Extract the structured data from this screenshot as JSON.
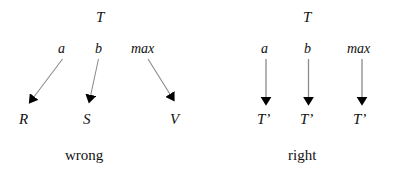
{
  "figure": {
    "background_color": "#ffffff",
    "text_color": "#111111",
    "arrow_shaft_color": "#8a8a8a",
    "arrow_head_color": "#000000",
    "panels": [
      {
        "id": "wrong",
        "caption": "wrong",
        "root_label": "T",
        "edges": [
          {
            "label": "a",
            "target": "R"
          },
          {
            "label": "b",
            "target": "S"
          },
          {
            "label": "max",
            "target": "V"
          }
        ]
      },
      {
        "id": "right",
        "caption": "right",
        "root_label": "T",
        "edges": [
          {
            "label": "a",
            "target": "T’"
          },
          {
            "label": "b",
            "target": "T’"
          },
          {
            "label": "max",
            "target": "T’"
          }
        ]
      }
    ]
  },
  "left": {
    "root": "T",
    "edge_a": "a",
    "edge_b": "b",
    "edge_max": "max",
    "target_a": "R",
    "target_b": "S",
    "target_max": "V",
    "caption": "wrong"
  },
  "right": {
    "root": "T",
    "edge_a": "a",
    "edge_b": "b",
    "edge_max": "max",
    "target_a": "T’",
    "target_b": "T’",
    "target_max": "T’",
    "caption": "right"
  }
}
